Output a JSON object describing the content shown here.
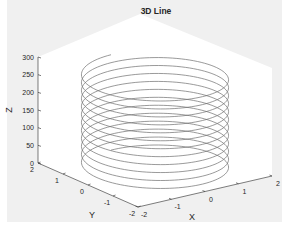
{
  "chart_data": {
    "type": "line",
    "subtype": "3d-line-helix",
    "title": "3D Line",
    "xlabel": "X",
    "ylabel": "Y",
    "zlabel": "Z",
    "xlim": [
      -2,
      2
    ],
    "ylim": [
      -2,
      2
    ],
    "zlim": [
      0,
      300
    ],
    "x_ticks": [
      "-2",
      "-1",
      "0",
      "1",
      "2"
    ],
    "y_ticks": [
      "-2",
      "-1",
      "0",
      "1",
      "2"
    ],
    "z_ticks": [
      "0",
      "50",
      "100",
      "150",
      "200",
      "250",
      "300"
    ],
    "grid": false,
    "legend": null,
    "series": [
      {
        "name": "helix",
        "description": "x = 2*sin(t), y = 2*cos(t), z = t (approx. 12 turns from z=0 to z~270)",
        "radius": 2,
        "z_start": 0,
        "z_end": 270,
        "turns": 12,
        "color": "#6e6e6e"
      }
    ]
  },
  "colors": {
    "figure_background": "#f0f0f0",
    "axes_background": "#ffffff",
    "axis_line": "#262626",
    "line": "#6e6e6e"
  }
}
